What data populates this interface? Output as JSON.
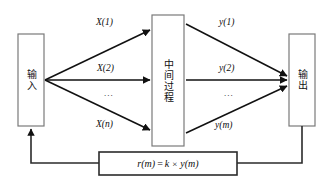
{
  "diagram": {
    "type": "block-flow-diagram",
    "nodes": {
      "input": {
        "label": "输入"
      },
      "process": {
        "label": "中间过程"
      },
      "output": {
        "label": "输出"
      },
      "feedback": {
        "formula_lhs": "r(m)",
        "formula_eq": "=",
        "formula_gain": "k",
        "formula_times": "×",
        "formula_rhs": "y(m)"
      }
    },
    "input_edges": [
      {
        "label": "X(1)"
      },
      {
        "label": "X(2)"
      },
      {
        "label": "X(n)"
      }
    ],
    "input_ellipsis": "...",
    "output_edges": [
      {
        "label": "y(1)"
      },
      {
        "label": "y(2)"
      },
      {
        "label": "y(m)"
      }
    ],
    "output_ellipsis": "...",
    "colors": {
      "stroke": "#111111",
      "box_border": "#7a7a7a",
      "background": "#ffffff",
      "text": "#111111"
    }
  }
}
